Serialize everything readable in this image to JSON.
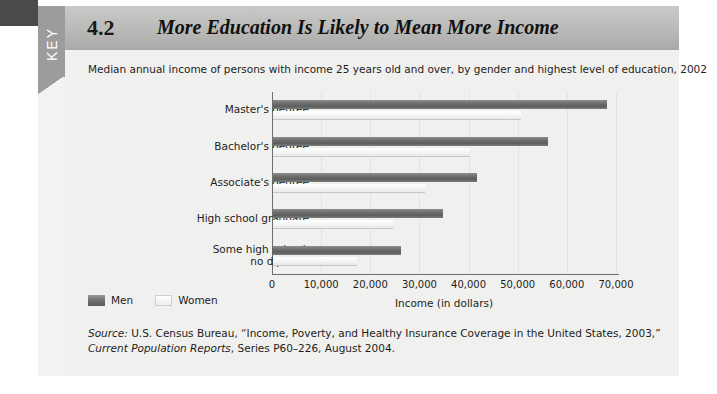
{
  "figure": {
    "key_tab_label": "KEY",
    "number": "4.2",
    "title": "More Education Is Likely to Mean More Income",
    "subtitle": "Median annual income of persons with income 25 years old and over, by gender and highest level of education, 2002"
  },
  "source": {
    "label": "Source:",
    "text_1": " U.S. Census Bureau, “Income, Poverty, and Healthy Insurance Coverage in the United States, 2003,” ",
    "italic_1": "Current Population Reports",
    "text_2": ", Series P60–226, August 2004."
  },
  "legend": {
    "men": "Men",
    "women": "Women"
  },
  "colors": {
    "men_bar": "#6f6f6f",
    "women_bar": "#f2f2f0",
    "header_band": "#b9b9b7",
    "key_tab": "#9c9c9c",
    "panel": "#f0f0ee",
    "axis": "#6e6e6e",
    "grid": "#e3e3e1"
  },
  "chart_data": {
    "type": "bar",
    "orientation": "horizontal",
    "title": "More Education Is Likely to Mean More Income",
    "subtitle": "Median annual income of persons with income 25 years old and over, by gender and highest level of education, 2002",
    "xlabel": "Income (in dollars)",
    "ylabel": "",
    "xlim": [
      0,
      70000
    ],
    "xticks": [
      0,
      10000,
      20000,
      30000,
      40000,
      50000,
      60000,
      70000
    ],
    "xtick_labels": [
      "0",
      "10,000",
      "20,000",
      "30,000",
      "40,000",
      "50,000",
      "60,000",
      "70,000"
    ],
    "grid": true,
    "legend_position": "bottom-left",
    "categories": [
      "Master's degree",
      "Bachelor's degree",
      "Associate's degree",
      "High school graduate",
      "Some high school,\nno diploma"
    ],
    "category_lines": [
      [
        "Master's degree"
      ],
      [
        "Bachelor's degree"
      ],
      [
        "Associate's degree"
      ],
      [
        "High school graduate"
      ],
      [
        "Some high school,",
        "no diploma"
      ]
    ],
    "series": [
      {
        "name": "Men",
        "color": "#6f6f6f",
        "values": [
          68000,
          56000,
          41500,
          34500,
          26000
        ]
      },
      {
        "name": "Women",
        "color": "#f2f2f0",
        "values": [
          50500,
          40000,
          31000,
          24500,
          17000
        ]
      }
    ]
  }
}
